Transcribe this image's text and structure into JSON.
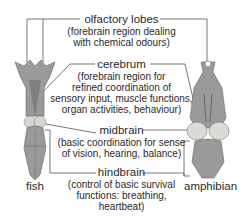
{
  "labels": {
    "olfactory": {
      "title": "olfactory lobes",
      "desc1": "(forebrain region dealing",
      "desc2": "with chemical odours)"
    },
    "cerebrum": {
      "title": "cerebrum",
      "desc1": "(forebrain region for",
      "desc2": "refined coordination of",
      "desc3": "sensory input, muscle functions,",
      "desc4": "organ activities, behaviour)"
    },
    "midbrain": {
      "title": "midbrain",
      "desc1": "(basic coordination for sense",
      "desc2": "of vision, hearing, balance)"
    },
    "hindbrain": {
      "title": "hindbrain",
      "desc1": "(control of basic survival",
      "desc2": "functions: breathing,",
      "desc3": "heartbeat)"
    }
  },
  "specimens": {
    "left": "fish",
    "right": "amphibian"
  }
}
